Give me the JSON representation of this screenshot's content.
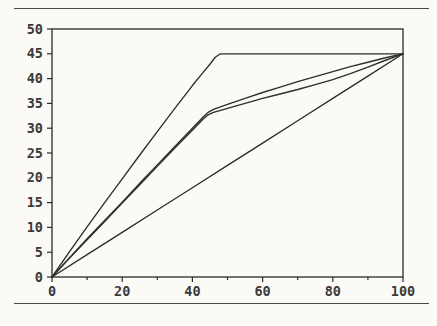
{
  "figure": {
    "background_color": "#fbfaf6",
    "line_color": "#2e2e2e",
    "axis_color": "#2b2b2b",
    "rule_color": "#4a4a4a",
    "has_top_rule": true,
    "has_bottom_rule": true
  },
  "chart_data": {
    "type": "line",
    "title": "",
    "subtitle": "",
    "xlabel": "",
    "ylabel": "",
    "xlim": [
      0,
      100
    ],
    "ylim": [
      0,
      50
    ],
    "grid": false,
    "legend": null,
    "legend_position": "none",
    "annotations": [],
    "x_major_ticks": [
      0,
      20,
      40,
      60,
      80,
      100
    ],
    "x_minor_ticks": [
      10,
      30,
      50,
      70,
      90
    ],
    "x_tick_labels": [
      "0",
      "20",
      "40",
      "60",
      "80",
      "100"
    ],
    "y_major_ticks": [
      0,
      5,
      10,
      15,
      20,
      25,
      30,
      35,
      40,
      45,
      50
    ],
    "y_tick_labels": [
      "0",
      "5",
      "10",
      "15",
      "20",
      "25",
      "30",
      "35",
      "40",
      "45",
      "50"
    ],
    "series": [
      {
        "name": "curve-1-saturating",
        "points": [
          [
            0,
            0
          ],
          [
            5,
            5.1
          ],
          [
            10,
            10.1
          ],
          [
            15,
            15.0
          ],
          [
            20,
            19.8
          ],
          [
            25,
            24.6
          ],
          [
            30,
            29.3
          ],
          [
            35,
            34.0
          ],
          [
            40,
            38.6
          ],
          [
            43,
            41.2
          ],
          [
            45,
            42.9
          ],
          [
            46.5,
            44.3
          ],
          [
            48,
            45.0
          ],
          [
            55,
            45.0
          ],
          [
            65,
            45.0
          ],
          [
            75,
            45.0
          ],
          [
            85,
            45.0
          ],
          [
            95,
            45.0
          ],
          [
            100,
            45.0
          ]
        ]
      },
      {
        "name": "curve-2-upper-kinked",
        "points": [
          [
            0,
            0
          ],
          [
            5,
            3.9
          ],
          [
            10,
            7.7
          ],
          [
            15,
            11.4
          ],
          [
            20,
            15.1
          ],
          [
            25,
            18.9
          ],
          [
            30,
            22.6
          ],
          [
            35,
            26.3
          ],
          [
            40,
            30.0
          ],
          [
            43,
            32.2
          ],
          [
            44.5,
            33.2
          ],
          [
            46,
            33.8
          ],
          [
            50,
            34.8
          ],
          [
            55,
            36.0
          ],
          [
            60,
            37.2
          ],
          [
            65,
            38.3
          ],
          [
            70,
            39.4
          ],
          [
            75,
            40.4
          ],
          [
            80,
            41.4
          ],
          [
            85,
            42.4
          ],
          [
            90,
            43.3
          ],
          [
            95,
            44.2
          ],
          [
            100,
            45.0
          ]
        ]
      },
      {
        "name": "curve-3-lower-kinked",
        "points": [
          [
            0,
            0
          ],
          [
            5,
            3.8
          ],
          [
            10,
            7.5
          ],
          [
            15,
            11.2
          ],
          [
            20,
            14.9
          ],
          [
            25,
            18.6
          ],
          [
            30,
            22.3
          ],
          [
            35,
            26.0
          ],
          [
            40,
            29.6
          ],
          [
            43,
            31.8
          ],
          [
            44.5,
            32.7
          ],
          [
            46,
            33.2
          ],
          [
            50,
            34.0
          ],
          [
            55,
            35.0
          ],
          [
            60,
            36.0
          ],
          [
            65,
            36.9
          ],
          [
            70,
            37.8
          ],
          [
            75,
            38.8
          ],
          [
            80,
            39.8
          ],
          [
            85,
            41.0
          ],
          [
            90,
            42.3
          ],
          [
            95,
            43.7
          ],
          [
            100,
            45.0
          ]
        ]
      },
      {
        "name": "curve-4-linear",
        "points": [
          [
            0,
            0
          ],
          [
            10,
            4.5
          ],
          [
            20,
            9.0
          ],
          [
            30,
            13.5
          ],
          [
            40,
            18.0
          ],
          [
            50,
            22.5
          ],
          [
            60,
            27.0
          ],
          [
            70,
            31.5
          ],
          [
            80,
            36.0
          ],
          [
            90,
            40.5
          ],
          [
            100,
            45.0
          ]
        ]
      }
    ]
  }
}
